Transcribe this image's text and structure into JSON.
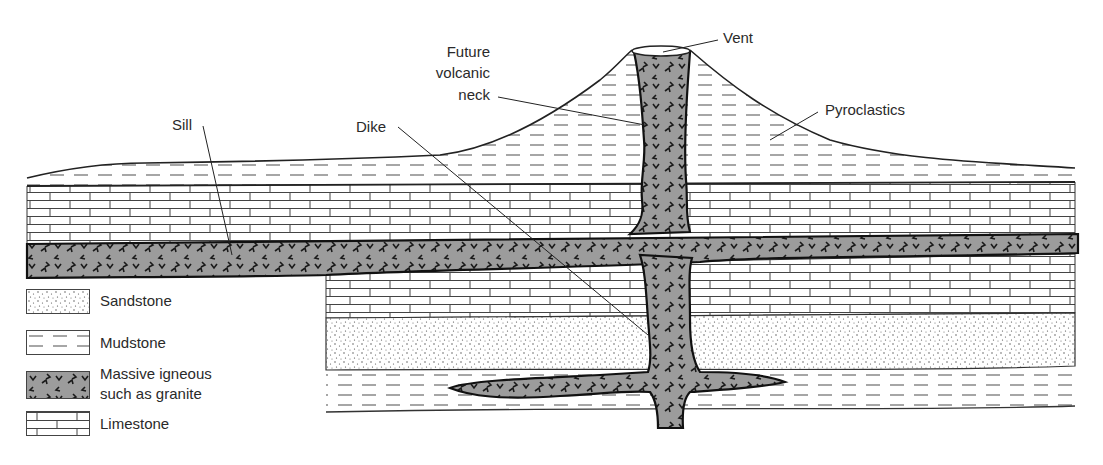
{
  "diagram": {
    "labels": {
      "vent": "Vent",
      "future_neck": [
        "Future",
        "volcanic",
        "neck"
      ],
      "pyroclastics": "Pyroclastics",
      "sill": "Sill",
      "dike": "Dike"
    },
    "legend": [
      {
        "key": "sandstone",
        "label": "Sandstone",
        "pattern": "dots"
      },
      {
        "key": "mudstone",
        "label": "Mudstone",
        "pattern": "dashes"
      },
      {
        "key": "igneous",
        "label_line1": "Massive igneous",
        "label_line2": "such as granite",
        "pattern": "grey-with-v-marks"
      },
      {
        "key": "limestone",
        "label": "Limestone",
        "pattern": "bricks"
      }
    ],
    "colors": {
      "igneous_fill": "#9a9a9a",
      "line": "#222222",
      "dash": "#666666",
      "background": "#ffffff"
    }
  }
}
